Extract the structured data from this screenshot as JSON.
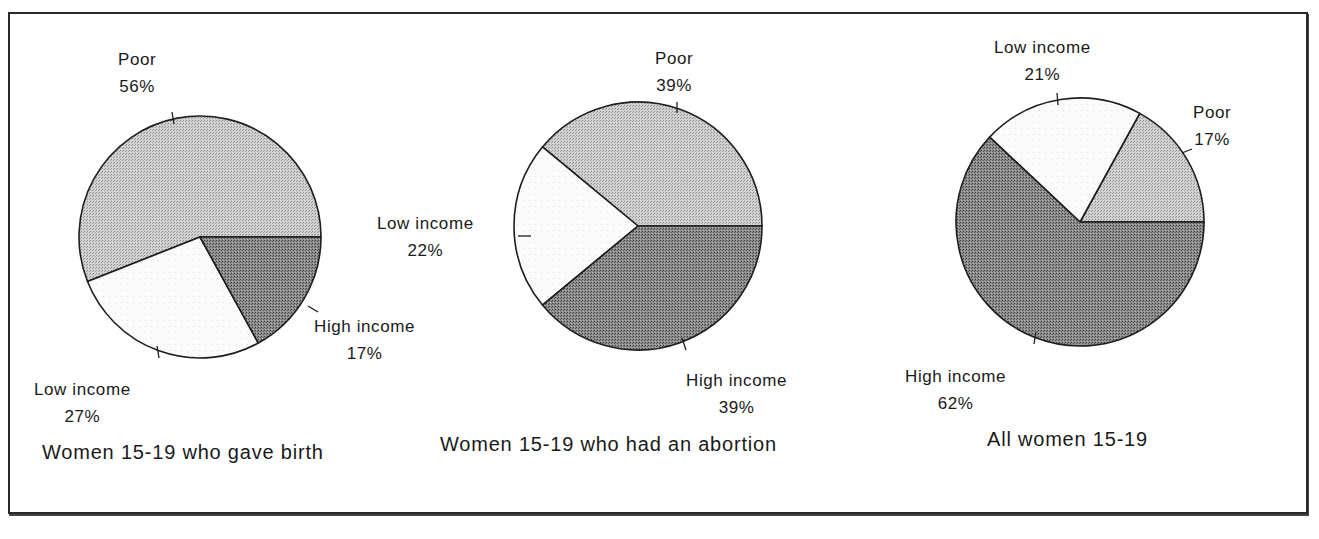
{
  "figure": {
    "charts": [
      {
        "title": "Women 15-19 who gave birth",
        "slices": [
          {
            "label": "Poor",
            "value_text": "56%"
          },
          {
            "label": "Low income",
            "value_text": "27%"
          },
          {
            "label": "High income",
            "value_text": "17%"
          }
        ]
      },
      {
        "title": "Women 15-19 who had an abortion",
        "slices": [
          {
            "label": "Poor",
            "value_text": "39%"
          },
          {
            "label": "Low income",
            "value_text": "22%"
          },
          {
            "label": "High income",
            "value_text": "39%"
          }
        ]
      },
      {
        "title": "All women 15-19",
        "slices": [
          {
            "label": "Poor",
            "value_text": "17%"
          },
          {
            "label": "Low income",
            "value_text": "21%"
          },
          {
            "label": "High income",
            "value_text": "62%"
          }
        ]
      }
    ]
  },
  "colors": {
    "poor": "#c4c4c4",
    "low_income": "#f7f7f7",
    "high_income": "#8a8a8a",
    "outline": "#1e1e1e"
  },
  "chart_data": [
    {
      "type": "pie",
      "title": "Women 15-19 who gave birth",
      "categories": [
        "Poor",
        "Low income",
        "High income"
      ],
      "values": [
        56,
        27,
        17
      ],
      "unit": "%"
    },
    {
      "type": "pie",
      "title": "Women 15-19 who had an abortion",
      "categories": [
        "Poor",
        "Low income",
        "High income"
      ],
      "values": [
        39,
        22,
        39
      ],
      "unit": "%"
    },
    {
      "type": "pie",
      "title": "All women 15-19",
      "categories": [
        "Poor",
        "Low income",
        "High income"
      ],
      "values": [
        17,
        21,
        62
      ],
      "unit": "%"
    }
  ]
}
